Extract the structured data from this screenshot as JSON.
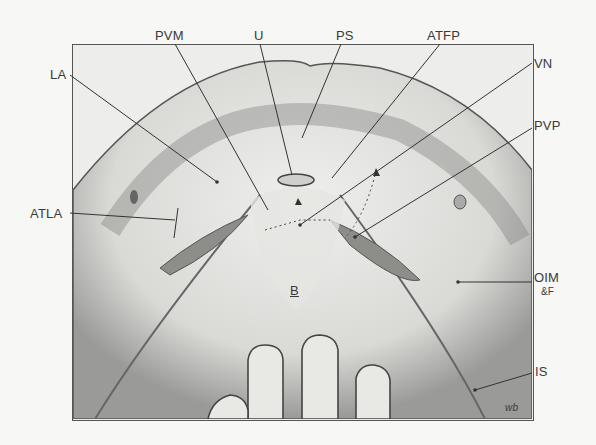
{
  "figure": {
    "signature": "wb",
    "labels": {
      "PVM": "PVM",
      "U": "U",
      "PS": "PS",
      "ATFP": "ATFP",
      "LA": "LA",
      "VN": "VN",
      "PVP": "PVP",
      "ATLA": "ATLA",
      "OIM": "OIM",
      "F": "&F",
      "B": "B",
      "IS": "IS"
    }
  }
}
